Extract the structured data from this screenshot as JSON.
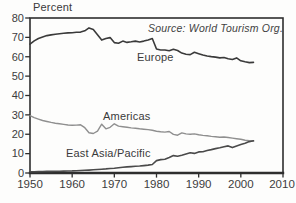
{
  "chart_data": {
    "type": "line",
    "unit_label": "Percent",
    "source_note": "Source: World Tourism Org.",
    "xlabel": "",
    "ylabel": "Percent",
    "xlim": [
      1950,
      2010
    ],
    "ylim": [
      0,
      80
    ],
    "x_ticks": [
      1950,
      1960,
      1970,
      1980,
      1990,
      2000,
      2010
    ],
    "y_ticks": [
      0,
      10,
      20,
      30,
      40,
      50,
      60,
      70,
      80
    ],
    "grid": false,
    "legend_position": "inline-annotations",
    "years": [
      1950,
      1951,
      1952,
      1953,
      1954,
      1955,
      1956,
      1957,
      1958,
      1959,
      1960,
      1961,
      1962,
      1963,
      1964,
      1965,
      1966,
      1967,
      1968,
      1969,
      1970,
      1971,
      1972,
      1973,
      1974,
      1975,
      1976,
      1977,
      1978,
      1979,
      1980,
      1981,
      1982,
      1983,
      1984,
      1985,
      1986,
      1987,
      1988,
      1989,
      1990,
      1991,
      1992,
      1993,
      1994,
      1995,
      1996,
      1997,
      1998,
      1999,
      2000,
      2001,
      2002,
      2003
    ],
    "series": [
      {
        "name": "Europe",
        "color": "#3a3a3a",
        "stroke_width": 1.6,
        "values": [
          66.5,
          68.2,
          69.4,
          70.2,
          70.9,
          71.3,
          71.6,
          71.9,
          72.1,
          72.3,
          72.4,
          72.6,
          72.7,
          73.4,
          74.9,
          74.1,
          71.4,
          68.6,
          69.4,
          69.9,
          67.3,
          67.0,
          68.1,
          67.4,
          67.7,
          68.1,
          67.6,
          68.1,
          68.7,
          69.4,
          64.0,
          63.5,
          63.5,
          63.1,
          63.9,
          63.2,
          61.9,
          61.3,
          61.1,
          62.3,
          61.6,
          60.9,
          60.4,
          60.1,
          59.8,
          59.4,
          59.6,
          59.0,
          58.6,
          59.4,
          57.9,
          57.4,
          57.0,
          57.1
        ]
      },
      {
        "name": "Americas",
        "color": "#8f8f8f",
        "stroke_width": 1.4,
        "values": [
          29.6,
          28.6,
          27.8,
          27.1,
          26.6,
          26.1,
          25.7,
          25.4,
          25.1,
          24.8,
          24.6,
          24.7,
          24.9,
          23.4,
          20.8,
          20.4,
          21.6,
          25.2,
          22.8,
          23.6,
          25.4,
          24.2,
          23.9,
          23.6,
          23.3,
          23.1,
          22.8,
          22.6,
          22.4,
          22.1,
          21.6,
          21.3,
          21.1,
          21.4,
          19.9,
          19.5,
          20.7,
          20.2,
          20.0,
          20.2,
          19.7,
          19.4,
          19.2,
          18.9,
          18.7,
          18.5,
          18.6,
          18.3,
          18.0,
          17.7,
          17.4,
          16.9,
          16.6,
          16.5
        ]
      },
      {
        "name": "East Asia/Pacific",
        "color": "#4a4a4a",
        "stroke_width": 1.6,
        "values": [
          0.6,
          0.65,
          0.7,
          0.75,
          0.8,
          0.85,
          0.9,
          0.95,
          1.0,
          1.05,
          1.1,
          1.2,
          1.3,
          1.4,
          1.5,
          1.65,
          1.8,
          1.95,
          2.1,
          2.3,
          2.5,
          2.75,
          3.0,
          3.15,
          3.3,
          3.45,
          3.6,
          3.8,
          4.1,
          4.4,
          6.4,
          6.9,
          7.1,
          8.0,
          9.0,
          8.6,
          9.2,
          9.8,
          10.4,
          10.1,
          10.9,
          11.0,
          11.6,
          12.1,
          12.6,
          13.0,
          13.5,
          14.0,
          13.1,
          14.0,
          14.7,
          15.4,
          16.2,
          16.6
        ]
      }
    ],
    "colors": {
      "frame": "#2e2e2e",
      "tick": "#2e2e2e",
      "text": "#3c3c3c",
      "background": "#fdfdfc"
    }
  }
}
